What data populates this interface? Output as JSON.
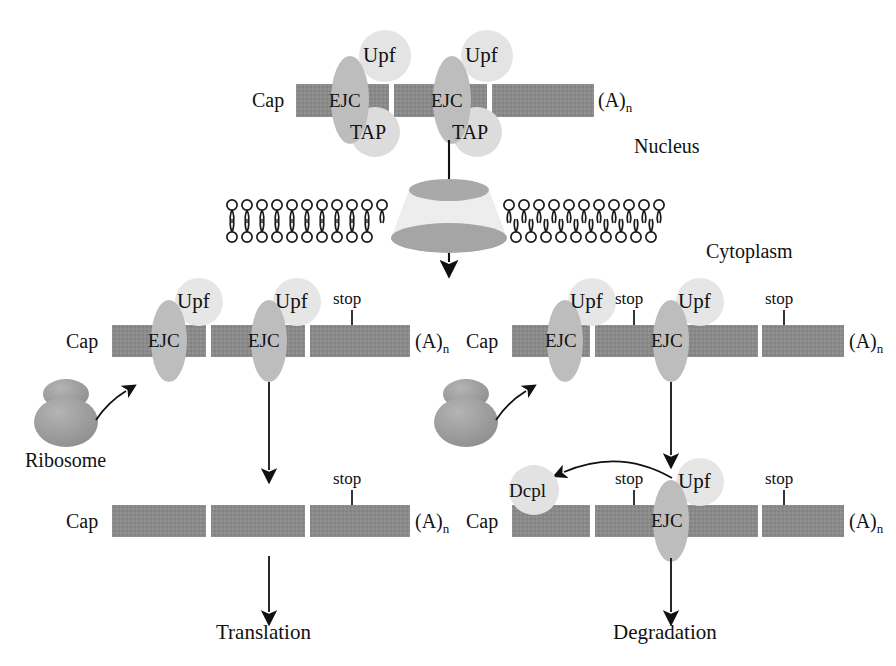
{
  "figure": {
    "colors": {
      "mrna_bar": "#8a8a8a",
      "ejc_body": "#bdbdbd",
      "upf_body": "#e2e2e2",
      "tap_body": "#dcdcdc",
      "dcpl_body": "#e0e0e0",
      "ribosome": "#9a9a9a",
      "pore_rim": "#a9a9a9",
      "pore_body": "#e6e6e6",
      "membrane_ink": "#1a1a1a",
      "arrow": "#111111",
      "text": "#111111",
      "background": "#ffffff"
    }
  },
  "compartments": {
    "nucleus_label": "Nucleus",
    "cytoplasm_label": "Cytoplasm"
  },
  "nuclear_mrna": {
    "cap_label": "Cap",
    "polya_label": "(A)",
    "polya_subscript": "n",
    "complexes": [
      {
        "ejc_label": "EJC",
        "upf_label": "Upf",
        "tap_label": "TAP"
      },
      {
        "ejc_label": "EJC",
        "upf_label": "Upf",
        "tap_label": "TAP"
      }
    ]
  },
  "left_branch": {
    "name": "normal-mrna-branch",
    "mrna": {
      "cap_label": "Cap",
      "polya_label": "(A)",
      "polya_subscript": "n",
      "complexes": [
        {
          "ejc_label": "EJC",
          "upf_label": "Upf"
        },
        {
          "ejc_label": "EJC",
          "upf_label": "Upf"
        }
      ],
      "stops": [
        {
          "label": "stop",
          "kind": "normal"
        }
      ]
    },
    "ribosome_label": "Ribosome",
    "product_mrna": {
      "cap_label": "Cap",
      "polya_label": "(A)",
      "polya_subscript": "n",
      "stops": [
        {
          "label": "stop",
          "kind": "normal"
        }
      ]
    },
    "outcome_label": "Translation"
  },
  "right_branch": {
    "name": "nonsense-mrna-branch",
    "mrna": {
      "cap_label": "Cap",
      "polya_label": "(A)",
      "polya_subscript": "n",
      "complexes": [
        {
          "ejc_label": "EJC",
          "upf_label": "Upf"
        },
        {
          "ejc_label": "EJC",
          "upf_label": "Upf"
        }
      ],
      "stops": [
        {
          "label": "stop",
          "kind": "premature"
        },
        {
          "label": "stop",
          "kind": "normal"
        }
      ]
    },
    "ribosome_label": "",
    "product_mrna": {
      "cap_label": "Cap",
      "polya_label": "(A)",
      "polya_subscript": "n",
      "decapping_label": "Dcpl",
      "complexes": [
        {
          "ejc_label": "EJC",
          "upf_label": "Upf"
        }
      ],
      "stops": [
        {
          "label": "stop",
          "kind": "premature"
        },
        {
          "label": "stop",
          "kind": "normal"
        }
      ]
    },
    "outcome_label": "Degradation"
  }
}
